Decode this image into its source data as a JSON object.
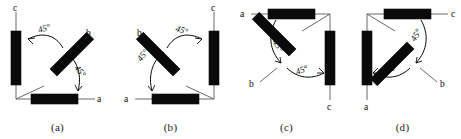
{
  "figure": {
    "type": "diagram",
    "background_color": "#ffffff",
    "ink_color": "#0a0a0a",
    "lead_color": "#5a5a5a",
    "angle_value": "45°",
    "panels": [
      {
        "id": "a",
        "caption": "(a)",
        "terminals": [
          {
            "name": "c",
            "label": "c",
            "position": "top-left"
          },
          {
            "name": "b",
            "label": "b",
            "position": "upper-right"
          },
          {
            "name": "a",
            "label": "a",
            "position": "right"
          }
        ],
        "angles": [
          {
            "label": "45°",
            "between": "c-coil and b-coil"
          },
          {
            "label": "45°",
            "between": "b-coil and a-coil"
          }
        ],
        "coils": [
          {
            "name": "coil-c",
            "orientation": "vertical"
          },
          {
            "name": "coil-b",
            "orientation": "diagonal-45"
          },
          {
            "name": "coil-a",
            "orientation": "horizontal"
          }
        ]
      },
      {
        "id": "b",
        "caption": "(b)",
        "terminals": [
          {
            "name": "c",
            "label": "c",
            "position": "top-right"
          },
          {
            "name": "b",
            "label": "b",
            "position": "upper-left"
          },
          {
            "name": "a",
            "label": "a",
            "position": "left"
          }
        ],
        "angles": [
          {
            "label": "45°",
            "between": "b-coil and c-coil"
          },
          {
            "label": "45°",
            "between": "a-coil and b-coil"
          }
        ],
        "coils": [
          {
            "name": "coil-c",
            "orientation": "vertical"
          },
          {
            "name": "coil-b",
            "orientation": "diagonal-135"
          },
          {
            "name": "coil-a",
            "orientation": "horizontal"
          }
        ]
      },
      {
        "id": "c",
        "caption": "(c)",
        "terminals": [
          {
            "name": "a",
            "label": "a",
            "position": "top-left"
          },
          {
            "name": "b",
            "label": "b",
            "position": "lower-left"
          },
          {
            "name": "c",
            "label": "c",
            "position": "bottom-right"
          }
        ],
        "angles": [
          {
            "label": "45°",
            "between": "a-coil and b-coil"
          },
          {
            "label": "45°",
            "between": "b-coil and c-coil"
          }
        ],
        "coils": [
          {
            "name": "coil-a",
            "orientation": "horizontal"
          },
          {
            "name": "coil-b",
            "orientation": "diagonal-135"
          },
          {
            "name": "coil-c",
            "orientation": "vertical"
          }
        ]
      },
      {
        "id": "d",
        "caption": "(d)",
        "terminals": [
          {
            "name": "c",
            "label": "c",
            "position": "top-right"
          },
          {
            "name": "b",
            "label": "b",
            "position": "lower-right"
          },
          {
            "name": "a",
            "label": "a",
            "position": "bottom-left"
          }
        ],
        "angles": [
          {
            "label": "45°",
            "between": "b-coil and c-coil"
          },
          {
            "label": "45°",
            "between": "a-coil and b-coil"
          }
        ],
        "coils": [
          {
            "name": "coil-c",
            "orientation": "horizontal"
          },
          {
            "name": "coil-b",
            "orientation": "diagonal-45"
          },
          {
            "name": "coil-a",
            "orientation": "vertical"
          }
        ]
      }
    ]
  }
}
